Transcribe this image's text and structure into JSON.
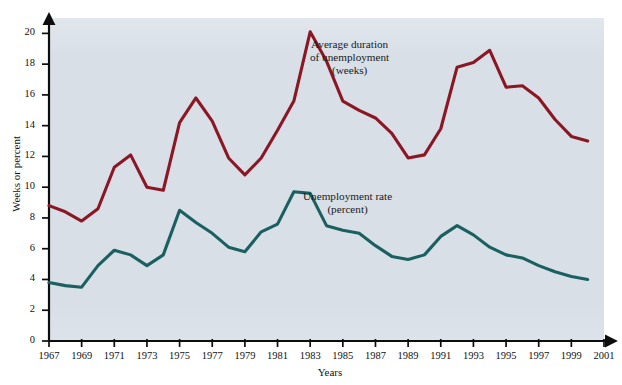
{
  "chart_data": {
    "type": "line",
    "title": "",
    "xlabel": "Years",
    "ylabel": "Weeks or percent",
    "xlim": [
      1967,
      2001
    ],
    "ylim": [
      0,
      21
    ],
    "grid": false,
    "legend_position": "inline-annotations",
    "x": [
      1967,
      1968,
      1969,
      1970,
      1971,
      1972,
      1973,
      1974,
      1975,
      1976,
      1977,
      1978,
      1979,
      1980,
      1981,
      1982,
      1983,
      1984,
      1985,
      1986,
      1987,
      1988,
      1989,
      1990,
      1991,
      1992,
      1993,
      1994,
      1995,
      1996,
      1997,
      1998,
      1999,
      2000
    ],
    "series": [
      {
        "name": "Average duration of unemployment (weeks)",
        "color": "#8b1724",
        "units": "weeks",
        "values": [
          8.8,
          8.4,
          7.8,
          8.6,
          11.3,
          12.1,
          10.0,
          9.8,
          14.2,
          15.8,
          14.3,
          11.9,
          10.8,
          11.9,
          13.7,
          15.6,
          20.1,
          18.2,
          15.6,
          15.0,
          14.5,
          13.5,
          11.9,
          12.1,
          13.8,
          17.8,
          18.1,
          18.9,
          16.5,
          16.6,
          15.8,
          14.4,
          13.3,
          13.0
        ]
      },
      {
        "name": "Unemployment rate (percent)",
        "color": "#1a6060",
        "units": "percent",
        "values": [
          3.8,
          3.6,
          3.5,
          4.9,
          5.9,
          5.6,
          4.9,
          5.6,
          8.5,
          7.7,
          7.0,
          6.1,
          5.8,
          7.1,
          7.6,
          9.7,
          9.6,
          7.5,
          7.2,
          7.0,
          6.2,
          5.5,
          5.3,
          5.6,
          6.8,
          7.5,
          6.9,
          6.1,
          5.6,
          5.4,
          4.9,
          4.5,
          4.2,
          4.0
        ]
      }
    ],
    "y_ticks": [
      0,
      2,
      4,
      6,
      8,
      10,
      12,
      14,
      16,
      18,
      20
    ],
    "x_ticks": [
      1967,
      1969,
      1971,
      1973,
      1975,
      1977,
      1979,
      1981,
      1983,
      1985,
      1987,
      1989,
      1991,
      1993,
      1995,
      1997,
      1999,
      2001
    ]
  },
  "axes": {
    "y_title": "Weeks or percent",
    "x_title": "Years",
    "y_tick_labels": [
      "0",
      "2",
      "4",
      "6",
      "8",
      "10",
      "12",
      "14",
      "16",
      "18",
      "20"
    ],
    "x_tick_labels": [
      "1967",
      "1969",
      "1971",
      "1973",
      "1975",
      "1977",
      "1979",
      "1981",
      "1983",
      "1985",
      "1987",
      "1989",
      "1991",
      "1993",
      "1995",
      "1997",
      "1999",
      "2001"
    ]
  },
  "annotations": {
    "duration": {
      "line1": "Average duration",
      "line2": "of unemployment",
      "line3": "(weeks)"
    },
    "rate": {
      "line1": "Unemployment rate",
      "line2": "(percent)"
    }
  },
  "colors": {
    "duration_line": "#8b1724",
    "rate_line": "#1a6060",
    "plot_background": "#d8dfe7",
    "axis": "#0d0d0d",
    "page_background": "#ffffff"
  }
}
